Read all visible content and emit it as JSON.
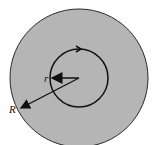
{
  "diagram": {
    "outer_circle": {
      "cx": 79,
      "cy": 78,
      "r": 69,
      "fill": "#b5b5b5",
      "stroke": "#2a2a2a"
    },
    "inner_circle": {
      "cx": 79,
      "cy": 78,
      "r": 29,
      "stroke": "#111111"
    },
    "labels": {
      "outer_radius": "R",
      "inner_radius": "r"
    },
    "colors": {
      "background": "#ffffff",
      "ink": "#111111"
    }
  }
}
